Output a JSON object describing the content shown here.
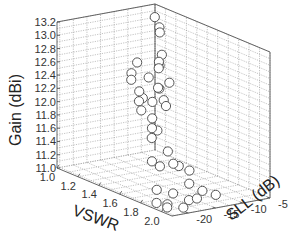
{
  "chart_data": {
    "type": "scatter3d",
    "title": "",
    "xlabel": "VSWR",
    "ylabel": "SLL (dB)",
    "zlabel": "Gain (dBi)",
    "x_ticks": [
      "1.0",
      "1.2",
      "1.4",
      "1.6",
      "1.8",
      "2.0"
    ],
    "y_ticks": [
      "-20",
      "-15",
      "-10",
      "-5"
    ],
    "z_ticks": [
      "11.0",
      "11.2",
      "11.4",
      "11.6",
      "11.8",
      "12.0",
      "12.2",
      "12.4",
      "12.6",
      "12.8",
      "13.0",
      "13.2"
    ],
    "xlim": [
      1.0,
      2.1
    ],
    "ylim": [
      -23,
      -5
    ],
    "zlim": [
      11.0,
      13.2
    ],
    "grid": true,
    "legend": null,
    "marker": "open-circle",
    "points": [
      {
        "x": 1.05,
        "y": -6.0,
        "z": 13.05
      },
      {
        "x": 1.12,
        "y": -6.5,
        "z": 12.95
      },
      {
        "x": 1.15,
        "y": -7.0,
        "z": 12.9
      },
      {
        "x": 1.3,
        "y": -9.5,
        "z": 12.7
      },
      {
        "x": 1.35,
        "y": -11.0,
        "z": 12.65
      },
      {
        "x": 1.4,
        "y": -12.0,
        "z": 12.6
      },
      {
        "x": 1.2,
        "y": -8.0,
        "z": 12.45
      },
      {
        "x": 1.55,
        "y": -15.0,
        "z": 12.45
      },
      {
        "x": 1.45,
        "y": -11.0,
        "z": 12.4
      },
      {
        "x": 1.6,
        "y": -14.5,
        "z": 12.2
      },
      {
        "x": 1.25,
        "y": -9.0,
        "z": 12.15
      },
      {
        "x": 1.5,
        "y": -13.0,
        "z": 12.2
      },
      {
        "x": 1.4,
        "y": -17.0,
        "z": 12.6
      },
      {
        "x": 1.45,
        "y": -18.0,
        "z": 12.55
      },
      {
        "x": 1.5,
        "y": -17.5,
        "z": 12.4
      },
      {
        "x": 1.55,
        "y": -18.5,
        "z": 12.3
      },
      {
        "x": 1.6,
        "y": -17.0,
        "z": 12.3
      },
      {
        "x": 1.65,
        "y": -18.0,
        "z": 12.1
      },
      {
        "x": 1.7,
        "y": -19.0,
        "z": 12.0
      },
      {
        "x": 1.7,
        "y": -18.0,
        "z": 11.95
      },
      {
        "x": 1.75,
        "y": -20.0,
        "z": 11.9
      },
      {
        "x": 1.8,
        "y": -18.0,
        "z": 11.7
      },
      {
        "x": 1.8,
        "y": -17.0,
        "z": 11.5
      },
      {
        "x": 1.75,
        "y": -18.5,
        "z": 11.45
      },
      {
        "x": 1.7,
        "y": -19.0,
        "z": 11.5
      },
      {
        "x": 1.8,
        "y": -16.0,
        "z": 11.45
      },
      {
        "x": 1.85,
        "y": -15.0,
        "z": 11.4
      },
      {
        "x": 1.9,
        "y": -16.0,
        "z": 11.25
      },
      {
        "x": 1.85,
        "y": -18.0,
        "z": 11.1
      },
      {
        "x": 1.95,
        "y": -17.0,
        "z": 11.05
      },
      {
        "x": 2.0,
        "y": -16.5,
        "z": 11.1
      },
      {
        "x": 2.0,
        "y": -15.5,
        "z": 11.2
      },
      {
        "x": 2.05,
        "y": -14.0,
        "z": 11.15
      },
      {
        "x": 1.9,
        "y": -20.0,
        "z": 11.0
      },
      {
        "x": 2.0,
        "y": -19.0,
        "z": 11.0
      },
      {
        "x": 1.95,
        "y": -21.0,
        "z": 11.0
      },
      {
        "x": 1.85,
        "y": -21.0,
        "z": 11.2
      },
      {
        "x": 1.9,
        "y": -22.0,
        "z": 11.05
      },
      {
        "x": 1.65,
        "y": -20.0,
        "z": 12.25
      },
      {
        "x": 1.3,
        "y": -13.0,
        "z": 12.1
      },
      {
        "x": 1.2,
        "y": -10.0,
        "z": 12.3
      },
      {
        "x": 1.35,
        "y": -15.0,
        "z": 12.7
      }
    ]
  },
  "axes": {
    "x_label": "VSWR",
    "y_label": "SLL (dB)",
    "z_label": "Gain (dBi)"
  }
}
